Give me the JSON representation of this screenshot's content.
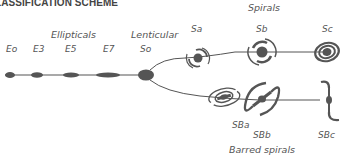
{
  "title": "LASSIFICATION SCHEME",
  "groups": {
    "ellipticals": "Ellipticals",
    "lenticular": "Lenticular",
    "spirals": "Spirals",
    "barred_spirals": "Barred spirals"
  },
  "elliptical_labels": [
    "Eo",
    "E3",
    "E5",
    "E7"
  ],
  "lenticular_label": "So",
  "spiral_labels": [
    "Sa",
    "Sb",
    "Sc"
  ],
  "barred_spiral_labels": [
    "SBa",
    "SBb",
    "SBc"
  ],
  "colors": {
    "shape": "#555555",
    "text": "#555555",
    "title": "#444444"
  }
}
